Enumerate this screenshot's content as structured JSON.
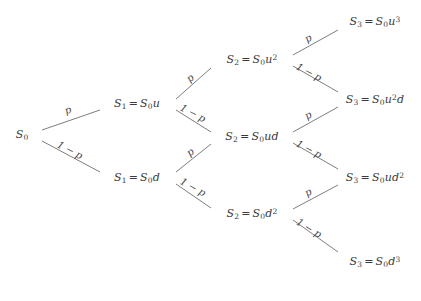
{
  "diagram": {
    "background_color": "#ffffff",
    "edge_color": "#6e6e6e",
    "text_color": "#3a3a3a",
    "up_probability_label": "p",
    "down_probability_label": "1 − p",
    "nodes": [
      {
        "id": "n0",
        "step": 0,
        "x": 22,
        "y": 135,
        "symbol": "S",
        "index": "0",
        "has_equation": false,
        "value": "",
        "text": "S₀"
      },
      {
        "id": "n_u",
        "step": 1,
        "x": 137,
        "y": 104,
        "symbol": "S",
        "index": "1",
        "has_equation": true,
        "value": "S₀u",
        "text": "S₁ = S₀u"
      },
      {
        "id": "n_d",
        "step": 1,
        "x": 137,
        "y": 178,
        "symbol": "S",
        "index": "1",
        "has_equation": true,
        "value": "S₀d",
        "text": "S₁ = S₀d"
      },
      {
        "id": "n_uu",
        "step": 2,
        "x": 252,
        "y": 60,
        "symbol": "S",
        "index": "2",
        "has_equation": true,
        "value": "S₀u²",
        "text": "S₂ = S₀u²"
      },
      {
        "id": "n_ud",
        "step": 2,
        "x": 252,
        "y": 137,
        "symbol": "S",
        "index": "2",
        "has_equation": true,
        "value": "S₀ud",
        "text": "S₂ = S₀ud"
      },
      {
        "id": "n_dd",
        "step": 2,
        "x": 252,
        "y": 214,
        "symbol": "S",
        "index": "2",
        "has_equation": true,
        "value": "S₀d²",
        "text": "S₂ = S₀d²"
      },
      {
        "id": "n_uuu",
        "step": 3,
        "x": 375,
        "y": 22,
        "symbol": "S",
        "index": "3",
        "has_equation": true,
        "value": "S₀u³",
        "text": "S₃ = S₀u³"
      },
      {
        "id": "n_uud",
        "step": 3,
        "x": 375,
        "y": 100,
        "symbol": "S",
        "index": "3",
        "has_equation": true,
        "value": "S₀u²d",
        "text": "S₃ = S₀u²d"
      },
      {
        "id": "n_udd",
        "step": 3,
        "x": 375,
        "y": 178,
        "symbol": "S",
        "index": "3",
        "has_equation": true,
        "value": "S₀ud²",
        "text": "S₃ = S₀ud²"
      },
      {
        "id": "n_ddd",
        "step": 3,
        "x": 375,
        "y": 262,
        "symbol": "S",
        "index": "3",
        "has_equation": true,
        "value": "S₀d³",
        "text": "S₃ = S₀d³"
      }
    ],
    "edges": [
      {
        "id": "e1",
        "from": "n0",
        "to": "n_u",
        "kind": "up",
        "label": "p",
        "x1": 42,
        "y1": 130,
        "x2": 100,
        "y2": 110,
        "lx": 68,
        "ly": 110,
        "rot": -19
      },
      {
        "id": "e2",
        "from": "n0",
        "to": "n_d",
        "kind": "down",
        "label": "1 − p",
        "x1": 42,
        "y1": 141,
        "x2": 100,
        "y2": 172,
        "lx": 70,
        "ly": 150,
        "rot": 28
      },
      {
        "id": "e3",
        "from": "n_u",
        "to": "n_uu",
        "kind": "up",
        "label": "p",
        "x1": 176,
        "y1": 99,
        "x2": 211,
        "y2": 68,
        "lx": 190,
        "ly": 78,
        "rot": -40
      },
      {
        "id": "e4",
        "from": "n_u",
        "to": "n_ud",
        "kind": "down",
        "label": "1 − p",
        "x1": 176,
        "y1": 110,
        "x2": 211,
        "y2": 132,
        "lx": 193,
        "ly": 113,
        "rot": 28
      },
      {
        "id": "e5",
        "from": "n_d",
        "to": "n_ud",
        "kind": "up",
        "label": "p",
        "x1": 176,
        "y1": 172,
        "x2": 211,
        "y2": 144,
        "lx": 190,
        "ly": 152,
        "rot": -38
      },
      {
        "id": "e6",
        "from": "n_d",
        "to": "n_dd",
        "kind": "down",
        "label": "1 − p",
        "x1": 176,
        "y1": 184,
        "x2": 211,
        "y2": 208,
        "lx": 193,
        "ly": 187,
        "rot": 29
      },
      {
        "id": "e7",
        "from": "n_uu",
        "to": "n_uuu",
        "kind": "up",
        "label": "p",
        "x1": 293,
        "y1": 55,
        "x2": 338,
        "y2": 30,
        "lx": 308,
        "ly": 38,
        "rot": -30
      },
      {
        "id": "e8",
        "from": "n_uu",
        "to": "n_uud",
        "kind": "down",
        "label": "1 − p",
        "x1": 293,
        "y1": 66,
        "x2": 338,
        "y2": 92,
        "lx": 309,
        "ly": 72,
        "rot": 28
      },
      {
        "id": "e9",
        "from": "n_ud",
        "to": "n_uud",
        "kind": "up",
        "label": "p",
        "x1": 293,
        "y1": 132,
        "x2": 338,
        "y2": 107,
        "lx": 308,
        "ly": 115,
        "rot": -30
      },
      {
        "id": "e10",
        "from": "n_ud",
        "to": "n_udd",
        "kind": "down",
        "label": "1 − p",
        "x1": 293,
        "y1": 143,
        "x2": 338,
        "y2": 169,
        "lx": 309,
        "ly": 149,
        "rot": 28
      },
      {
        "id": "e11",
        "from": "n_dd",
        "to": "n_udd",
        "kind": "up",
        "label": "p",
        "x1": 293,
        "y1": 209,
        "x2": 338,
        "y2": 185,
        "lx": 308,
        "ly": 192,
        "rot": -30
      },
      {
        "id": "e12",
        "from": "n_dd",
        "to": "n_ddd",
        "kind": "down",
        "label": "1 − p",
        "x1": 293,
        "y1": 220,
        "x2": 338,
        "y2": 252,
        "lx": 309,
        "ly": 228,
        "rot": 32
      }
    ]
  },
  "chart_data": {
    "type": "diagram",
    "subtype": "binomial-tree",
    "steps": 3,
    "initial_value": "S0",
    "up_factor": "u",
    "down_factor": "d",
    "up_probability": "p",
    "down_probability": "1 - p",
    "levels": [
      {
        "step": 0,
        "nodes": [
          {
            "label": "S_0",
            "expression": "S0"
          }
        ]
      },
      {
        "step": 1,
        "nodes": [
          {
            "label": "S_1 = S_0 u",
            "expression": "S0*u"
          },
          {
            "label": "S_1 = S_0 d",
            "expression": "S0*d"
          }
        ]
      },
      {
        "step": 2,
        "nodes": [
          {
            "label": "S_2 = S_0 u^2",
            "expression": "S0*u^2"
          },
          {
            "label": "S_2 = S_0 ud",
            "expression": "S0*u*d"
          },
          {
            "label": "S_2 = S_0 d^2",
            "expression": "S0*d^2"
          }
        ]
      },
      {
        "step": 3,
        "nodes": [
          {
            "label": "S_3 = S_0 u^3",
            "expression": "S0*u^3"
          },
          {
            "label": "S_3 = S_0 u^2 d",
            "expression": "S0*u^2*d"
          },
          {
            "label": "S_3 = S_0 u d^2",
            "expression": "S0*u*d^2"
          },
          {
            "label": "S_3 = S_0 d^3",
            "expression": "S0*d^3"
          }
        ]
      }
    ],
    "transitions": [
      {
        "from": "S_0",
        "to": "S_1 = S_0 u",
        "probability": "p"
      },
      {
        "from": "S_0",
        "to": "S_1 = S_0 d",
        "probability": "1 - p"
      },
      {
        "from": "S_1 = S_0 u",
        "to": "S_2 = S_0 u^2",
        "probability": "p"
      },
      {
        "from": "S_1 = S_0 u",
        "to": "S_2 = S_0 ud",
        "probability": "1 - p"
      },
      {
        "from": "S_1 = S_0 d",
        "to": "S_2 = S_0 ud",
        "probability": "p"
      },
      {
        "from": "S_1 = S_0 d",
        "to": "S_2 = S_0 d^2",
        "probability": "1 - p"
      },
      {
        "from": "S_2 = S_0 u^2",
        "to": "S_3 = S_0 u^3",
        "probability": "p"
      },
      {
        "from": "S_2 = S_0 u^2",
        "to": "S_3 = S_0 u^2 d",
        "probability": "1 - p"
      },
      {
        "from": "S_2 = S_0 ud",
        "to": "S_3 = S_0 u^2 d",
        "probability": "p"
      },
      {
        "from": "S_2 = S_0 ud",
        "to": "S_3 = S_0 u d^2",
        "probability": "1 - p"
      },
      {
        "from": "S_2 = S_0 d^2",
        "to": "S_3 = S_0 u d^2",
        "probability": "p"
      },
      {
        "from": "S_2 = S_0 d^2",
        "to": "S_3 = S_0 d^3",
        "probability": "1 - p"
      }
    ],
    "legend": [],
    "grid": false
  }
}
